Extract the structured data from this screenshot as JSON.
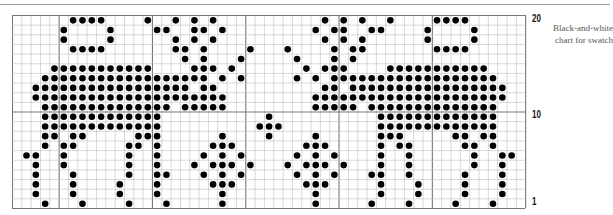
{
  "chart": {
    "columns": 55,
    "rows": 20,
    "cell_width": 9.33,
    "cell_height": 9.65,
    "major_col_lines": [
      5,
      15,
      25,
      35,
      45
    ],
    "major_row_lines_after_row": [
      10
    ],
    "colors": {
      "stitch": "#000000",
      "grid": "#bdbdbd",
      "major_grid": "#777777",
      "border": "#777777"
    },
    "row_labels": [
      {
        "text": "20",
        "row": 20
      },
      {
        "text": "10",
        "row": 10
      },
      {
        "text": "1",
        "row": 1
      }
    ],
    "stitches_by_row": {
      "20": "6,7,8,9,14,17,19,21,33,35,37,40,45,46,47,48",
      "19": "5,10,15,16,19,20,22,32,34,35,38,39,44,49",
      "18": "5,10,17,19,21,33,35,37,44,49",
      "17": "6,7,8,9,17,18,20,25,29,34,36,37,45,46,47,48",
      "16": "18,20,24,30,34,36",
      "15": "4-14,19,20,21,23,31,33,34,35,40-50",
      "14": "3-20,22,24,30,32,34-51",
      "13": "2-18,20,21,33,34,36-52",
      "12": "2-22,32-52",
      "11": "3-16,18-22,32-36,38-51",
      "10": "3-15,27,39-51",
      "9": "3-15,26,27,28,39-51",
      "8": "3,4,6,7,13,14,15,22,27,32,39,40,41,47,48,50,51",
      "7": "3,5,6,12,13,15,21,22,23,31,32,33,39,41,42,48,49,51",
      "6": "1,2,5,12,15,20,22,24,30,32,34,39,42,49,52,53",
      "5": "2,5,12,15,19,21,22,23,25,29,31,32,33,35,39,42,49,52",
      "4": "2,6,12,15,16,20,22,24,30,32,34,38,39,42,48,52",
      "3": "2,6,11,15,21,22,23,31,32,33,39,43,48,52",
      "2": "2,6,11,15,22,32,39,43,48,52",
      "1": "3,7,12,16,22,32,38,42,47,51"
    }
  },
  "caption": {
    "line1": "Black-and-white",
    "line2": "chart for swatch"
  }
}
